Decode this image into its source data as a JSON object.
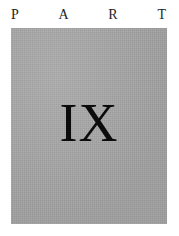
{
  "page": {
    "background_color": "#ffffff",
    "kind": "book-part-title-page"
  },
  "header": {
    "word": "PART",
    "letters": [
      "P",
      "A",
      "R",
      "T"
    ],
    "color": "#242424"
  },
  "panel": {
    "fill_color": "#a7a8a7",
    "numeral": "IX",
    "numeral_color": "#0b0b0b",
    "numeral_value": "9"
  }
}
